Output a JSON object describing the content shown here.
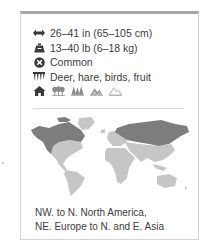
{
  "facts": {
    "length": {
      "icon": "length-arrows-icon",
      "text": "26–41 in (65–105 cm)"
    },
    "weight": {
      "icon": "weight-icon",
      "text": "13–40 lb (6–18 kg)"
    },
    "status": {
      "icon": "status-icon",
      "text": "Common"
    },
    "diet": {
      "icon": "diet-icon",
      "text": "Deer, hare, birds, fruit"
    }
  },
  "habitats": [
    {
      "icon": "home-icon",
      "label": "habitat"
    },
    {
      "icon": "deciduous-forest-icon",
      "label": "forest"
    },
    {
      "icon": "coniferous-forest-icon",
      "label": "coniferous forest"
    },
    {
      "icon": "mountain-icon",
      "label": "mountains"
    },
    {
      "icon": "tundra-icon",
      "label": "tundra"
    }
  ],
  "map": {
    "land_color": "#c6c6c6",
    "range_color": "#7d7d7d"
  },
  "range_text": {
    "line1": "NW. to N. North America,",
    "line2": "NE. Europe to N. and E. Asia"
  }
}
